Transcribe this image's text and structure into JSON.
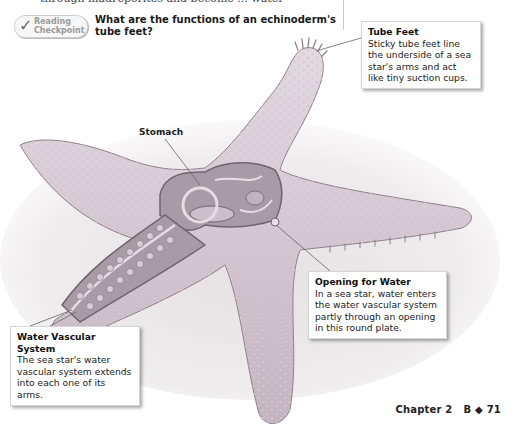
{
  "page": {
    "clipped_top_text": "through madreporites and become ... water",
    "reading_checkpoint": {
      "badge_line1": "Reading",
      "badge_line2": "Checkpoint",
      "question": "What are the functions of an echinoderm's tube feet?"
    },
    "figure": {
      "subject": "Sea star (echinoderm) cutaway illustration",
      "colors": {
        "body": "#d9cdd6",
        "body_shade": "#b9a9b6",
        "interior": "#a89aa5",
        "background_sand": "#ece9ea"
      },
      "labels": {
        "stomach": "Stomach"
      },
      "callouts": [
        {
          "id": "tube-feet",
          "title": "Tube Feet",
          "body": "Sticky tube feet line the underside of a sea star's arms and act like tiny suction cups."
        },
        {
          "id": "opening-for-water",
          "title": "Opening for Water",
          "body": "In a sea star, water enters the water vascular system partly through an opening in this round plate."
        },
        {
          "id": "water-vascular-system",
          "title": "Water Vascular System",
          "body": "The sea star's water vascular system extends into each one of its arms."
        }
      ]
    },
    "footer": {
      "chapter": "Chapter 2",
      "section": "B",
      "separator": "◆",
      "page_number": "71"
    }
  }
}
